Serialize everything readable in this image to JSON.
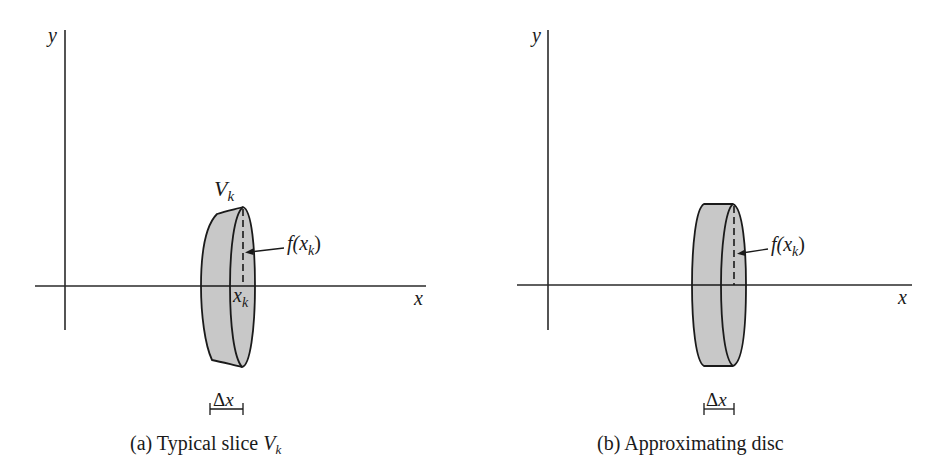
{
  "figure": {
    "colors": {
      "ink": "#1a1a1a",
      "solid_fill": "#c8c8c8",
      "background": "#ffffff"
    },
    "panels": [
      {
        "id": "a",
        "axis_labels": {
          "x": "x",
          "y": "y"
        },
        "solid_label_main": "V",
        "solid_label_sub": "k",
        "height_label_main": "f(x",
        "height_label_sub": "k",
        "height_label_close": ")",
        "point_label_main": "x",
        "point_label_sub": "k",
        "width_label_delta": "Δ",
        "width_label_var": "x",
        "caption_prefix": "(a)  Typical slice ",
        "caption_var": "V",
        "caption_sub": "k"
      },
      {
        "id": "b",
        "axis_labels": {
          "x": "x",
          "y": "y"
        },
        "height_label_main": "f(x",
        "height_label_sub": "k",
        "height_label_close": ")",
        "width_label_delta": "Δ",
        "width_label_var": "x",
        "caption": "(b)  Approximating disc"
      }
    ]
  }
}
